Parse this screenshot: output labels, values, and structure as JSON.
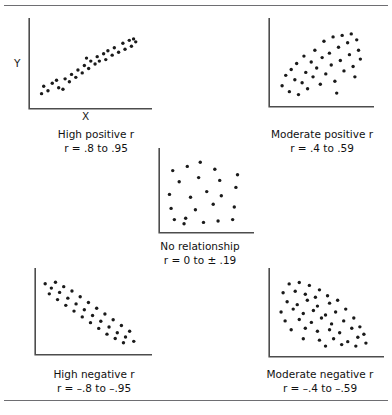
{
  "figure": {
    "rule_color": "#6e6e72",
    "dot_color": "#1a1a1a",
    "axis_color": "#4d4d4d"
  },
  "axis_labels": {
    "y": "Y",
    "x": "X"
  },
  "chart_data": [
    {
      "id": "high-positive",
      "type": "scatter",
      "title": "High positive r",
      "value_label": "r  =  .8 to .95",
      "r_range": [
        0.8,
        0.95
      ],
      "xlabel": "X",
      "ylabel": "Y",
      "xlim": [
        0,
        100
      ],
      "ylim": [
        0,
        100
      ],
      "grid": false,
      "points": [
        [
          8,
          14
        ],
        [
          14,
          18
        ],
        [
          10,
          24
        ],
        [
          18,
          28
        ],
        [
          24,
          22
        ],
        [
          22,
          32
        ],
        [
          28,
          20
        ],
        [
          30,
          34
        ],
        [
          34,
          30
        ],
        [
          36,
          40
        ],
        [
          40,
          36
        ],
        [
          42,
          46
        ],
        [
          46,
          42
        ],
        [
          48,
          52
        ],
        [
          52,
          48
        ],
        [
          54,
          58
        ],
        [
          50,
          62
        ],
        [
          58,
          54
        ],
        [
          60,
          64
        ],
        [
          62,
          58
        ],
        [
          66,
          68
        ],
        [
          68,
          60
        ],
        [
          70,
          72
        ],
        [
          74,
          66
        ],
        [
          76,
          76
        ],
        [
          80,
          70
        ],
        [
          84,
          82
        ],
        [
          86,
          74
        ],
        [
          90,
          86
        ],
        [
          92,
          78
        ],
        [
          94,
          88
        ],
        [
          96,
          84
        ]
      ]
    },
    {
      "id": "moderate-positive",
      "type": "scatter",
      "title": "Moderate positive r",
      "value_label": "r  =  .4 to .59",
      "r_range": [
        0.4,
        0.59
      ],
      "xlim": [
        0,
        100
      ],
      "ylim": [
        0,
        100
      ],
      "grid": false,
      "points": [
        [
          10,
          22
        ],
        [
          14,
          36
        ],
        [
          18,
          14
        ],
        [
          20,
          44
        ],
        [
          24,
          30
        ],
        [
          26,
          52
        ],
        [
          28,
          10
        ],
        [
          32,
          26
        ],
        [
          34,
          62
        ],
        [
          36,
          40
        ],
        [
          38,
          18
        ],
        [
          42,
          54
        ],
        [
          44,
          34
        ],
        [
          46,
          70
        ],
        [
          48,
          46
        ],
        [
          52,
          24
        ],
        [
          54,
          60
        ],
        [
          56,
          82
        ],
        [
          58,
          38
        ],
        [
          62,
          66
        ],
        [
          64,
          50
        ],
        [
          66,
          88
        ],
        [
          68,
          28
        ],
        [
          72,
          74
        ],
        [
          74,
          56
        ],
        [
          76,
          90
        ],
        [
          78,
          42
        ],
        [
          82,
          80
        ],
        [
          84,
          64
        ],
        [
          86,
          92
        ],
        [
          88,
          48
        ],
        [
          92,
          84
        ],
        [
          94,
          70
        ],
        [
          96,
          58
        ],
        [
          90,
          34
        ],
        [
          70,
          12
        ]
      ]
    },
    {
      "id": "no-relationship",
      "type": "scatter",
      "title": "No relationship",
      "value_label": "r  =  0 to ± .19",
      "r_range": [
        0.0,
        0.19
      ],
      "xlim": [
        0,
        100
      ],
      "ylim": [
        0,
        100
      ],
      "grid": false,
      "points": [
        [
          12,
          82
        ],
        [
          30,
          88
        ],
        [
          46,
          94
        ],
        [
          64,
          84
        ],
        [
          20,
          66
        ],
        [
          44,
          72
        ],
        [
          70,
          68
        ],
        [
          8,
          48
        ],
        [
          34,
          44
        ],
        [
          54,
          52
        ],
        [
          72,
          46
        ],
        [
          90,
          58
        ],
        [
          10,
          28
        ],
        [
          40,
          26
        ],
        [
          62,
          34
        ],
        [
          88,
          30
        ],
        [
          14,
          12
        ],
        [
          28,
          14
        ],
        [
          26,
          6
        ],
        [
          50,
          8
        ],
        [
          68,
          10
        ],
        [
          86,
          12
        ],
        [
          92,
          76
        ]
      ]
    },
    {
      "id": "high-negative",
      "type": "scatter",
      "title": "High negative r",
      "value_label": "r  =  –.8 to –.95",
      "r_range": [
        -0.8,
        -0.95
      ],
      "xlim": [
        0,
        100
      ],
      "ylim": [
        0,
        100
      ],
      "grid": false,
      "points": [
        [
          6,
          92
        ],
        [
          12,
          86
        ],
        [
          16,
          94
        ],
        [
          10,
          78
        ],
        [
          20,
          80
        ],
        [
          24,
          88
        ],
        [
          18,
          70
        ],
        [
          28,
          72
        ],
        [
          32,
          82
        ],
        [
          26,
          62
        ],
        [
          36,
          64
        ],
        [
          40,
          74
        ],
        [
          34,
          54
        ],
        [
          44,
          56
        ],
        [
          48,
          66
        ],
        [
          42,
          46
        ],
        [
          52,
          48
        ],
        [
          56,
          58
        ],
        [
          50,
          38
        ],
        [
          60,
          40
        ],
        [
          64,
          50
        ],
        [
          58,
          30
        ],
        [
          68,
          32
        ],
        [
          72,
          42
        ],
        [
          66,
          22
        ],
        [
          76,
          24
        ],
        [
          80,
          34
        ],
        [
          74,
          16
        ],
        [
          84,
          18
        ],
        [
          88,
          26
        ],
        [
          82,
          10
        ],
        [
          92,
          12
        ]
      ]
    },
    {
      "id": "moderate-negative",
      "type": "scatter",
      "title": "Moderate negative r",
      "value_label": "r  =  –.4 to –.59",
      "r_range": [
        -0.4,
        -0.59
      ],
      "xlim": [
        0,
        100
      ],
      "ylim": [
        0,
        100
      ],
      "grid": false,
      "points": [
        [
          16,
          92
        ],
        [
          26,
          94
        ],
        [
          36,
          90
        ],
        [
          46,
          84
        ],
        [
          10,
          80
        ],
        [
          22,
          82
        ],
        [
          32,
          78
        ],
        [
          42,
          74
        ],
        [
          54,
          76
        ],
        [
          14,
          68
        ],
        [
          24,
          64
        ],
        [
          34,
          70
        ],
        [
          44,
          62
        ],
        [
          56,
          66
        ],
        [
          64,
          70
        ],
        [
          8,
          54
        ],
        [
          20,
          58
        ],
        [
          30,
          52
        ],
        [
          40,
          56
        ],
        [
          52,
          50
        ],
        [
          62,
          54
        ],
        [
          72,
          58
        ],
        [
          12,
          42
        ],
        [
          26,
          44
        ],
        [
          38,
          40
        ],
        [
          48,
          46
        ],
        [
          58,
          38
        ],
        [
          70,
          42
        ],
        [
          80,
          46
        ],
        [
          18,
          30
        ],
        [
          32,
          32
        ],
        [
          44,
          28
        ],
        [
          56,
          30
        ],
        [
          66,
          26
        ],
        [
          78,
          32
        ],
        [
          86,
          34
        ],
        [
          30,
          18
        ],
        [
          46,
          16
        ],
        [
          60,
          18
        ],
        [
          74,
          14
        ],
        [
          84,
          20
        ],
        [
          90,
          24
        ],
        [
          52,
          8
        ],
        [
          68,
          10
        ],
        [
          82,
          8
        ],
        [
          92,
          12
        ]
      ]
    }
  ]
}
